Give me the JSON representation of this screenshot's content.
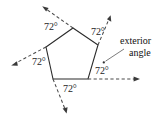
{
  "figure": {
    "shape": "pentagon",
    "stroke_color": "#2b2b2b",
    "ray_color": "#4a4a4a",
    "text_color": "#111111",
    "background": "#ffffff"
  },
  "angle_labels": [
    {
      "id": "top-left",
      "text": "72°",
      "x": 44,
      "y": 22
    },
    {
      "id": "top-right",
      "text": "72°",
      "x": 91,
      "y": 27
    },
    {
      "id": "left",
      "text": "72°",
      "x": 32,
      "y": 57
    },
    {
      "id": "bottom-right",
      "text": "72°",
      "x": 95,
      "y": 66
    },
    {
      "id": "bottom",
      "text": "72°",
      "x": 63,
      "y": 84
    }
  ],
  "callout": {
    "line1": "exterior",
    "line2": "angle",
    "x": 120,
    "y": 35
  },
  "geometry": {
    "vertices": [
      {
        "name": "top",
        "x": 73,
        "y": 28
      },
      {
        "name": "right",
        "x": 98,
        "y": 45
      },
      {
        "name": "bottom-right",
        "x": 88,
        "y": 79
      },
      {
        "name": "bottom-left",
        "x": 53,
        "y": 79
      },
      {
        "name": "left",
        "x": 46,
        "y": 47
      }
    ],
    "rays": [
      {
        "name": "ray-top-left",
        "from": {
          "x": 73,
          "y": 28
        },
        "to": {
          "x": 43,
          "y": 7
        }
      },
      {
        "name": "ray-top-right",
        "from": {
          "x": 98,
          "y": 45
        },
        "to": {
          "x": 110,
          "y": 16
        }
      },
      {
        "name": "ray-left",
        "from": {
          "x": 46,
          "y": 47
        },
        "to": {
          "x": 12,
          "y": 65
        }
      },
      {
        "name": "ray-bottom-right",
        "from": {
          "x": 88,
          "y": 79
        },
        "to": {
          "x": 139,
          "y": 79
        }
      },
      {
        "name": "ray-bottom-left",
        "from": {
          "x": 53,
          "y": 79
        },
        "to": {
          "x": 66,
          "y": 113
        }
      }
    ],
    "leader": {
      "from": {
        "x": 124,
        "y": 49
      },
      "to": {
        "x": 104,
        "y": 62
      }
    }
  }
}
